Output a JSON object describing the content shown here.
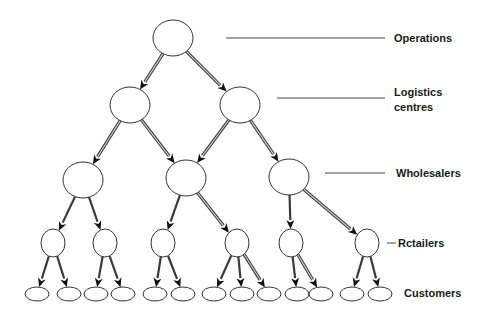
{
  "diagram": {
    "colors": {
      "background": "#ffffff",
      "node_stroke": "#333333",
      "edge_dark": "#3a3a3a",
      "edge_core": "#c8c8c8",
      "arrowhead": "#111111",
      "leader_line": "#444444",
      "label_text": "#1a1a1a"
    },
    "levels": [
      {
        "id": "operations",
        "label_lines": [
          "Operations"
        ],
        "label_x": 394,
        "label_y": 31,
        "leader": [
          226,
          38,
          385,
          38
        ]
      },
      {
        "id": "logistics",
        "label_lines": [
          "Logistics",
          "centres"
        ],
        "label_x": 394,
        "label_y": 85,
        "leader": [
          277,
          98,
          385,
          98
        ]
      },
      {
        "id": "wholesalers",
        "label_lines": [
          "Wholesalers"
        ],
        "label_x": 396,
        "label_y": 166,
        "leader": [
          325,
          173,
          385,
          173
        ]
      },
      {
        "id": "retailers",
        "label_lines": [
          "Rctailers"
        ],
        "label_x": 398,
        "label_y": 236,
        "leader": [
          387,
          243,
          396,
          243
        ]
      },
      {
        "id": "customers",
        "label_lines": [
          "Customers"
        ],
        "label_x": 404,
        "label_y": 286,
        "leader": null
      }
    ],
    "nodes": [
      {
        "id": "op",
        "level": "operations",
        "cx": 173,
        "cy": 38,
        "rx": 20,
        "ry": 18
      },
      {
        "id": "lc1",
        "level": "logistics",
        "cx": 130,
        "cy": 105,
        "rx": 20,
        "ry": 18
      },
      {
        "id": "lc2",
        "level": "logistics",
        "cx": 240,
        "cy": 105,
        "rx": 20,
        "ry": 18
      },
      {
        "id": "w1",
        "level": "wholesalers",
        "cx": 83,
        "cy": 180,
        "rx": 20,
        "ry": 18
      },
      {
        "id": "w2",
        "level": "wholesalers",
        "cx": 186,
        "cy": 178,
        "rx": 20,
        "ry": 18
      },
      {
        "id": "w3",
        "level": "wholesalers",
        "cx": 289,
        "cy": 177,
        "rx": 20,
        "ry": 18
      },
      {
        "id": "r1",
        "level": "retailers",
        "cx": 53,
        "cy": 243,
        "rx": 12,
        "ry": 14
      },
      {
        "id": "r2",
        "level": "retailers",
        "cx": 105,
        "cy": 243,
        "rx": 12,
        "ry": 14
      },
      {
        "id": "r3",
        "level": "retailers",
        "cx": 163,
        "cy": 243,
        "rx": 12,
        "ry": 14
      },
      {
        "id": "r4",
        "level": "retailers",
        "cx": 237,
        "cy": 243,
        "rx": 12,
        "ry": 14
      },
      {
        "id": "r5",
        "level": "retailers",
        "cx": 291,
        "cy": 243,
        "rx": 12,
        "ry": 14
      },
      {
        "id": "r6",
        "level": "retailers",
        "cx": 367,
        "cy": 243,
        "rx": 12,
        "ry": 14
      },
      {
        "id": "c1",
        "level": "customers",
        "cx": 37,
        "cy": 294,
        "rx": 12,
        "ry": 7
      },
      {
        "id": "c2",
        "level": "customers",
        "cx": 69,
        "cy": 294,
        "rx": 12,
        "ry": 7
      },
      {
        "id": "c3",
        "level": "customers",
        "cx": 96,
        "cy": 294,
        "rx": 12,
        "ry": 7
      },
      {
        "id": "c4",
        "level": "customers",
        "cx": 123,
        "cy": 294,
        "rx": 12,
        "ry": 7
      },
      {
        "id": "c5",
        "level": "customers",
        "cx": 155,
        "cy": 294,
        "rx": 12,
        "ry": 7
      },
      {
        "id": "c6",
        "level": "customers",
        "cx": 183,
        "cy": 294,
        "rx": 12,
        "ry": 7
      },
      {
        "id": "c7",
        "level": "customers",
        "cx": 214,
        "cy": 294,
        "rx": 12,
        "ry": 7
      },
      {
        "id": "c8",
        "level": "customers",
        "cx": 242,
        "cy": 294,
        "rx": 12,
        "ry": 7
      },
      {
        "id": "c9",
        "level": "customers",
        "cx": 269,
        "cy": 294,
        "rx": 12,
        "ry": 7
      },
      {
        "id": "c10",
        "level": "customers",
        "cx": 297,
        "cy": 294,
        "rx": 12,
        "ry": 7
      },
      {
        "id": "c11",
        "level": "customers",
        "cx": 321,
        "cy": 294,
        "rx": 12,
        "ry": 7
      },
      {
        "id": "c12",
        "level": "customers",
        "cx": 352,
        "cy": 294,
        "rx": 12,
        "ry": 7
      },
      {
        "id": "c13",
        "level": "customers",
        "cx": 380,
        "cy": 294,
        "rx": 12,
        "ry": 7
      }
    ],
    "edges": [
      {
        "from": "op",
        "to": "lc1",
        "style": "double"
      },
      {
        "from": "op",
        "to": "lc2",
        "style": "double"
      },
      {
        "from": "lc1",
        "to": "w1",
        "style": "double"
      },
      {
        "from": "lc1",
        "to": "w2",
        "style": "double"
      },
      {
        "from": "lc2",
        "to": "w2",
        "style": "double"
      },
      {
        "from": "lc2",
        "to": "w3",
        "style": "double"
      },
      {
        "from": "w1",
        "to": "r1",
        "style": "solid"
      },
      {
        "from": "w1",
        "to": "r2",
        "style": "solid"
      },
      {
        "from": "w2",
        "to": "r3",
        "style": "solid"
      },
      {
        "from": "w2",
        "to": "r4",
        "style": "double"
      },
      {
        "from": "w3",
        "to": "r5",
        "style": "solid"
      },
      {
        "from": "w3",
        "to": "r6",
        "style": "double"
      },
      {
        "from": "r1",
        "to": "c1",
        "style": "solid"
      },
      {
        "from": "r1",
        "to": "c2",
        "style": "solid"
      },
      {
        "from": "r2",
        "to": "c3",
        "style": "solid"
      },
      {
        "from": "r2",
        "to": "c4",
        "style": "solid"
      },
      {
        "from": "r3",
        "to": "c5",
        "style": "solid"
      },
      {
        "from": "r3",
        "to": "c6",
        "style": "solid"
      },
      {
        "from": "r4",
        "to": "c7",
        "style": "solid"
      },
      {
        "from": "r4",
        "to": "c8",
        "style": "solid"
      },
      {
        "from": "r4",
        "to": "c9",
        "style": "double"
      },
      {
        "from": "r5",
        "to": "c10",
        "style": "solid"
      },
      {
        "from": "r5",
        "to": "c11",
        "style": "double"
      },
      {
        "from": "r6",
        "to": "c12",
        "style": "solid"
      },
      {
        "from": "r6",
        "to": "c13",
        "style": "solid"
      }
    ]
  }
}
